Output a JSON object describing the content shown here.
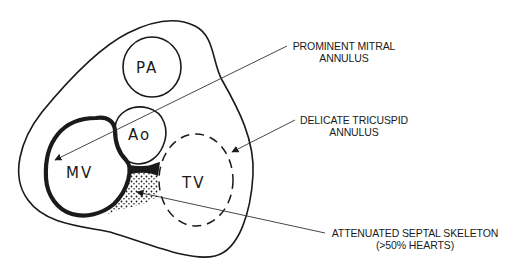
{
  "figure": {
    "type": "anatomical-diagram"
  },
  "structures": {
    "pa": {
      "label": "PA"
    },
    "ao": {
      "label": "Ao"
    },
    "mv": {
      "label": "MV"
    },
    "tv": {
      "label": "TV"
    }
  },
  "annotations": [
    {
      "line1": "PROMINENT MITRAL",
      "line2": "ANNULUS"
    },
    {
      "line1": "DELICATE TRICUSPID",
      "line2": "ANNULUS"
    },
    {
      "line1": "ATTENUATED SEPTAL SKELETON",
      "line2": "(>50% HEARTS)"
    }
  ],
  "colors": {
    "ink": "#1a1a1a",
    "background": "#ffffff"
  }
}
